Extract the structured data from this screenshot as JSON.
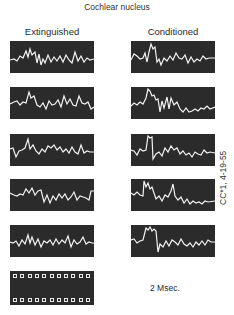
{
  "figure": {
    "title": "Cochlear nucleus",
    "columns": [
      {
        "label": "Extinguished"
      },
      {
        "label": "Conditioned"
      }
    ],
    "side_label": "CC*1, 4-19-55",
    "scale_label": "2 Msec.",
    "calibration_squares_per_row": 11,
    "colors": {
      "panel_background": "#2b2b2b",
      "trace": "#f2f2f2",
      "page": "#ffffff"
    },
    "traces": {
      "extinguished": [
        "0,19 4,18 7,20 10,15 13,17 16,10 18,16 20,8 22,14 25,11 27,22 29,13 31,24 33,18 35,22 38,14 41,21 44,16 47,20 50,15 53,21 56,14 59,19 62,22 65,11 68,20 71,15 74,21 77,17 80,19 84,18",
        "0,17 4,15 7,14 10,18 13,15 16,16 19,5 21,11 24,9 27,18 30,20 33,16 36,22 39,14 42,18 45,17 48,13 51,20 54,9 57,17 60,12 63,18 66,19 69,9 72,16 75,17 78,15 81,22 84,20",
        "0,15 3,14 6,23 9,17 12,16 15,14 18,5 20,15 23,11 26,17 29,20 32,15 35,18 38,12 41,14 44,11 47,16 50,13 53,18 56,15 59,19 62,13 65,18 68,20 71,11 74,19 77,17 80,18 84,18",
        "0,14 4,16 7,17 10,15 13,16 16,10 19,14 22,9 25,16 28,12 31,11 34,23 37,16 40,24 43,17 46,21 49,15 52,19 55,15 58,21 61,18 64,13 67,21 70,17 73,18 76,19 79,21 81,12 84,12",
        "0,17 3,18 6,16 9,21 12,15 15,19 18,10 20,18 22,12 25,20 28,14 31,22 34,16 37,18 40,15 43,20 46,14 49,19 52,15 55,18 58,11 61,22 64,15 67,19 70,17 73,12 76,19 79,17 82,18 84,18"
      ],
      "conditioned": [
        "0,19 3,13 6,15 9,18 12,17 14,12 16,21 18,11 20,3 22,8 24,6 26,21 28,18 30,24 33,17 36,20 39,15 42,19 45,12 48,17 51,18 54,14 57,22 60,16 63,21 66,18 69,20 72,15 75,18 78,17 84,17",
        "0,19 3,16 6,18 9,15 12,17 15,11 17,2 19,4 21,9 23,8 25,13 27,12 29,25 31,14 33,21 36,10 38,22 40,11 43,18 46,15 49,22 52,25 55,21 58,25 61,24 64,22 67,24 70,21 73,22 76,19 79,22 84,20",
        "0,16 3,17 6,21 9,15 12,17 15,16 17,2 19,4 21,3 22,25 25,20 28,18 31,22 34,14 37,18 40,12 43,16 46,14 49,20 52,17 55,21 58,19 61,23 64,18 67,20 70,21 73,16 76,19 79,18 84,19",
        "0,14 3,16 6,13 9,16 12,17 13,2 15,8 17,4 19,10 21,8 23,14 25,20 28,17 31,22 34,16 37,18 40,12 42,5 44,17 47,21 50,18 53,24 56,20 59,25 62,22 65,24 68,23 71,25 74,22 77,23 84,22",
        "0,15 3,14 6,18 9,16 12,15 15,3 17,5 19,2 21,6 23,4 25,6 27,27 29,19 32,22 35,16 38,21 41,15 44,17 47,20 50,14 53,19 56,21 59,18 62,22 65,17 68,20 71,16 74,20 77,15 80,17 84,17"
      ]
    }
  }
}
